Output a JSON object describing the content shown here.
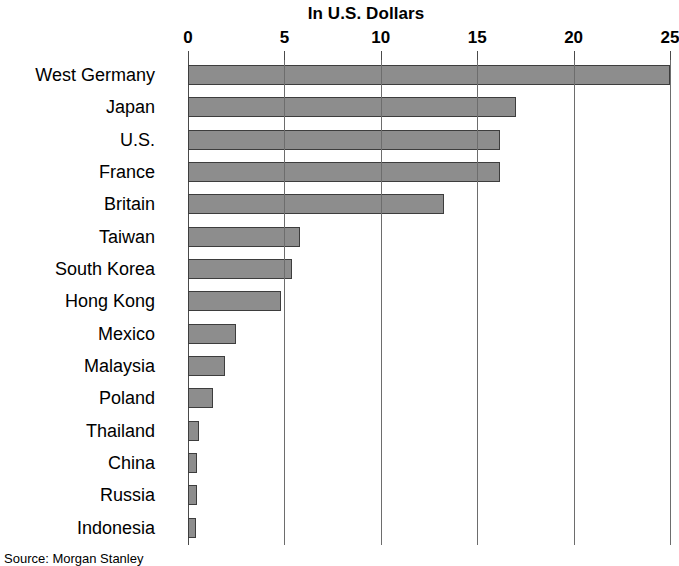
{
  "chart_data": {
    "type": "bar",
    "orientation": "horizontal",
    "title": "In U.S. Dollars",
    "xlabel": "",
    "ylabel": "",
    "xlim": [
      0,
      25
    ],
    "xticks": [
      0,
      5,
      10,
      15,
      20,
      25
    ],
    "xtick_labels": [
      "0",
      "5",
      "10",
      "15",
      "20",
      "25"
    ],
    "grid": true,
    "grid_axis": "x",
    "legend": false,
    "categories": [
      "West Germany",
      "Japan",
      "U.S.",
      "France",
      "Britain",
      "Taiwan",
      "South Korea",
      "Hong Kong",
      "Mexico",
      "Malaysia",
      "Poland",
      "Thailand",
      "China",
      "Russia",
      "Indonesia"
    ],
    "values": [
      25.0,
      17.0,
      16.2,
      16.2,
      13.3,
      5.8,
      5.4,
      4.8,
      2.5,
      1.9,
      1.3,
      0.55,
      0.45,
      0.45,
      0.4
    ],
    "bar_color": "#8d8d8d",
    "bar_edge_color": "#3d3d3d",
    "source": "Source: Morgan Stanley"
  }
}
